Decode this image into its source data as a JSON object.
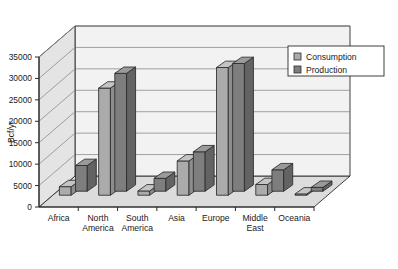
{
  "chart_data": {
    "type": "bar",
    "title": "",
    "subtitle": "",
    "xlabel": "",
    "ylabel": "Bcf/yr",
    "ylim": [
      0,
      35000
    ],
    "ytick_labels": [
      "0",
      "5000",
      "10000",
      "15000",
      "20000",
      "25000",
      "30000",
      "35000"
    ],
    "ytick_values": [
      0,
      5000,
      10000,
      15000,
      20000,
      25000,
      30000,
      35000
    ],
    "grid": true,
    "three_d": true,
    "legend_position": "top-right",
    "categories": [
      "Africa",
      "North America",
      "South America",
      "Asia",
      "Europe",
      "Middle East",
      "Oceania"
    ],
    "category_lines": [
      [
        "Africa"
      ],
      [
        "North",
        "America"
      ],
      [
        "South",
        "America"
      ],
      [
        "Asia"
      ],
      [
        "Europe"
      ],
      [
        "Middle",
        "East"
      ],
      [
        "Oceania"
      ]
    ],
    "series": [
      {
        "name": "Consumption",
        "color": "#ababab",
        "values": [
          2000,
          25000,
          1000,
          8000,
          29800,
          2500,
          300
        ]
      },
      {
        "name": "Production",
        "color": "#7e7e7e",
        "values": [
          6000,
          27500,
          3000,
          9200,
          29800,
          5000,
          900
        ]
      }
    ]
  },
  "legend": {
    "items": [
      {
        "label": "Consumption",
        "swatch": "#ababab"
      },
      {
        "label": "Production",
        "swatch": "#7e7e7e"
      }
    ]
  },
  "colors": {
    "consumption": "#ababab",
    "production": "#7e7e7e",
    "consumption_top": "#c4c4c4",
    "consumption_side": "#8d8d8d",
    "production_top": "#9a9a9a",
    "production_side": "#636363",
    "wall_back": "#f2f2f2",
    "wall_left": "#e4e4e4",
    "floor": "#dcdcdc",
    "outline": "#2b2b2b",
    "grid": "#8c8c8c",
    "text": "#1a1a1a",
    "background": "#ffffff"
  }
}
